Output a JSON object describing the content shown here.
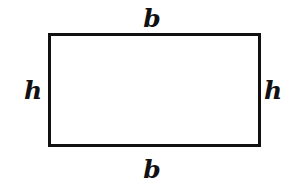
{
  "figure": {
    "type": "geometry-diagram",
    "shape": "rectangle",
    "background_color": "#ffffff",
    "stroke_color": "#111111",
    "stroke_width": 3,
    "rect": {
      "x": 48,
      "y": 33,
      "width": 213,
      "height": 114
    },
    "labels": {
      "top": "b",
      "bottom": "b",
      "left": "h",
      "right": "h"
    },
    "label_positions": {
      "top": {
        "x": 152,
        "y": 18
      },
      "bottom": {
        "x": 152,
        "y": 169
      },
      "left": {
        "x": 33,
        "y": 90
      },
      "right": {
        "x": 273,
        "y": 90
      }
    }
  }
}
